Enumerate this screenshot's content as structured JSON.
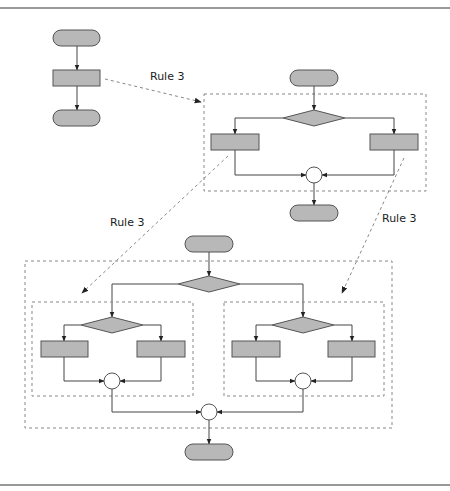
{
  "figure": {
    "colors": {
      "shape_fill": "#b8b8b8",
      "shape_stroke": "#555555",
      "line": "#444444",
      "dashed": "#888888",
      "frame": "#777777"
    }
  },
  "labels": {
    "rule_top": "Rule 3",
    "rule_left": "Rule 3",
    "rule_right": "Rule 3"
  },
  "diagrams": [
    {
      "name": "original-sequence",
      "nodes": [
        "terminal",
        "process",
        "terminal"
      ]
    },
    {
      "name": "rule3-result",
      "nodes": [
        "terminal",
        "decision",
        "process",
        "process",
        "merge-circle",
        "terminal"
      ]
    },
    {
      "name": "nested-rule3-result",
      "nodes": [
        "terminal",
        "decision",
        "decision",
        "process",
        "process",
        "merge-circle",
        "decision",
        "process",
        "process",
        "merge-circle",
        "merge-circle",
        "terminal"
      ]
    }
  ]
}
